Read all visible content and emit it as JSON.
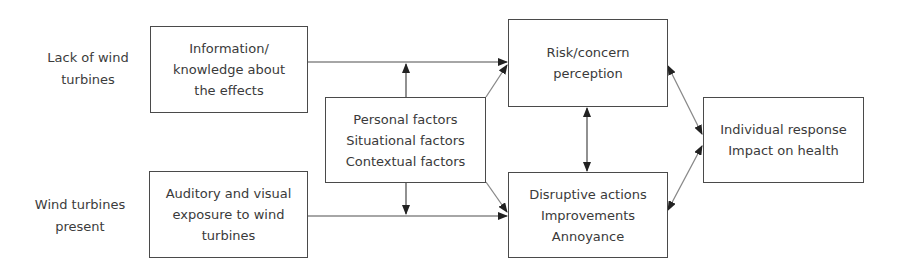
{
  "diagram": {
    "side_labels": {
      "top": [
        "Lack of wind",
        "turbines"
      ],
      "bottom": [
        "Wind turbines",
        "present"
      ]
    },
    "nodes": {
      "information": [
        "Information/",
        "knowledge about",
        "the effects"
      ],
      "exposure": [
        "Auditory and visual",
        "exposure to wind",
        "turbines"
      ],
      "factors": [
        "Personal factors",
        "Situational factors",
        "Contextual factors"
      ],
      "risk": [
        "Risk/concern",
        "perception"
      ],
      "disruptive": [
        "Disruptive actions",
        "Improvements",
        "Annoyance"
      ],
      "individual": [
        "Individual response",
        "Impact on health"
      ]
    },
    "edges": [
      {
        "from": "information",
        "to": "risk",
        "type": "arrow"
      },
      {
        "from": "exposure",
        "to": "disruptive",
        "type": "arrow"
      },
      {
        "from": "factors",
        "to": "information-risk-edge",
        "type": "arrow"
      },
      {
        "from": "factors",
        "to": "exposure-disruptive-edge",
        "type": "arrow"
      },
      {
        "from": "factors",
        "to": "risk",
        "type": "arrow"
      },
      {
        "from": "factors",
        "to": "disruptive",
        "type": "arrow"
      },
      {
        "from": "risk",
        "to": "disruptive",
        "type": "bidirectional"
      },
      {
        "from": "risk",
        "to": "individual",
        "type": "bidirectional"
      },
      {
        "from": "disruptive",
        "to": "individual",
        "type": "bidirectional"
      }
    ]
  }
}
